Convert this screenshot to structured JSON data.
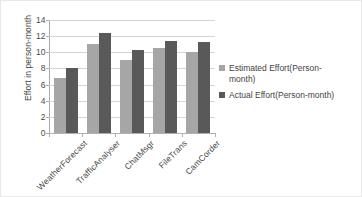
{
  "chart_data": {
    "type": "bar",
    "title": "",
    "xlabel": "",
    "ylabel": "Effort in person-month",
    "ylim": [
      0,
      14
    ],
    "yticks": [
      0,
      2,
      4,
      6,
      8,
      10,
      12,
      14
    ],
    "grid": true,
    "legend_position": "right",
    "categories": [
      "WeatherForecast",
      "TrafficAnalyser",
      "ChatMsgr",
      "FileTrans",
      "CamCorder"
    ],
    "series": [
      {
        "name": "Estimated Effort(Person-month)",
        "color": "#a6a6a6",
        "values": [
          6.8,
          11.0,
          9.0,
          10.5,
          10.0
        ]
      },
      {
        "name": "Actual Effort(Person-month)",
        "color": "#595959",
        "values": [
          8.0,
          12.4,
          10.3,
          11.4,
          11.3
        ]
      }
    ]
  },
  "axis": {
    "y_title": "Effort in person-month"
  },
  "legend": {
    "entries": [
      {
        "label": "Estimated Effort(Person-month)"
      },
      {
        "label": "Actual Effort(Person-month)"
      }
    ]
  }
}
